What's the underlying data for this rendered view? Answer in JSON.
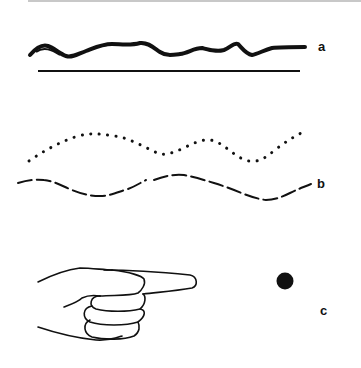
{
  "figure": {
    "colors": {
      "ink": "#111111",
      "background": "#ffffff",
      "top_rule": "#c8c8c8"
    },
    "panels": [
      {
        "id": "a",
        "label": "a",
        "description": "thick wavy line above a straight horizontal line"
      },
      {
        "id": "b",
        "label": "b",
        "description": "dotted wavy line above a dashed wavy line"
      },
      {
        "id": "c",
        "label": "c",
        "description": "hand with pointing index finger and a solid dot"
      }
    ]
  }
}
